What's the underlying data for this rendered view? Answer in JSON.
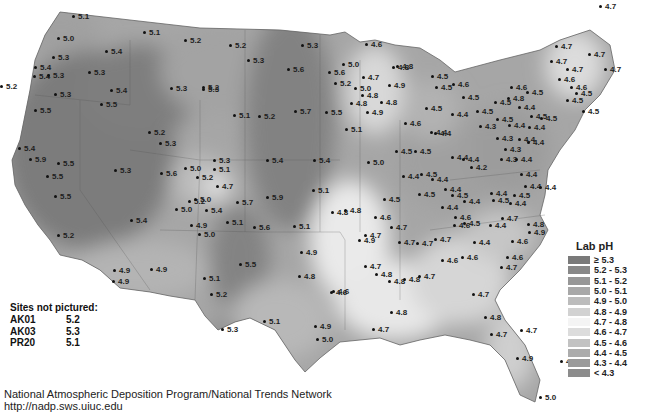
{
  "map": {
    "title": "Lab pH",
    "legend": {
      "title": "Lab pH",
      "items": [
        {
          "label": "≥ 5.3",
          "color": "#7a7a7a"
        },
        {
          "label": "5.2 - 5.3",
          "color": "#888888"
        },
        {
          "label": "5.1 - 5.2",
          "color": "#979797"
        },
        {
          "label": "5.0 - 5.1",
          "color": "#a8a8a8"
        },
        {
          "label": "4.9 - 5.0",
          "color": "#bcbcbc"
        },
        {
          "label": "4.8 - 4.9",
          "color": "#d2d2d2"
        },
        {
          "label": "4.7 - 4.8",
          "color": "#f4f4f4"
        },
        {
          "label": "4.6 - 4.7",
          "color": "#dcdcdc"
        },
        {
          "label": "4.5 - 4.6",
          "color": "#c2c2c2"
        },
        {
          "label": "4.4 - 4.5",
          "color": "#acacac"
        },
        {
          "label": "4.3 - 4.4",
          "color": "#9a9a9a"
        },
        {
          "label": "< 4.3",
          "color": "#8c8c8c"
        }
      ]
    },
    "sites_not_pictured": {
      "header": "Sites not pictured:",
      "rows": [
        {
          "id": "AK01",
          "value": "5.2"
        },
        {
          "id": "AK03",
          "value": "5.3"
        },
        {
          "id": "PR20",
          "value": "5.1"
        }
      ]
    },
    "footer": {
      "line1": "National Atmospheric Deposition Program/National Trends Network",
      "line2": "http://nadp.sws.uiuc.edu"
    },
    "sites": [
      {
        "x": 72,
        "y": 17,
        "v": "5.1"
      },
      {
        "x": 57,
        "y": 39,
        "v": "5.0"
      },
      {
        "x": 52,
        "y": 58,
        "v": "5.3"
      },
      {
        "x": 105,
        "y": 52,
        "v": "5.4"
      },
      {
        "x": 34,
        "y": 68,
        "v": "5.4"
      },
      {
        "x": 33,
        "y": 77,
        "v": "5.4"
      },
      {
        "x": 47,
        "y": 76,
        "v": "5.3"
      },
      {
        "x": 88,
        "y": 73,
        "v": "5.3"
      },
      {
        "x": 110,
        "y": 91,
        "v": "5.4"
      },
      {
        "x": 54,
        "y": 95,
        "v": "5.3"
      },
      {
        "x": 100,
        "y": 105,
        "v": "5.5"
      },
      {
        "x": 34,
        "y": 111,
        "v": "5.5"
      },
      {
        "x": 143,
        "y": 33,
        "v": "5.1"
      },
      {
        "x": 184,
        "y": 41,
        "v": "5.2"
      },
      {
        "x": 229,
        "y": 46,
        "v": "5.2"
      },
      {
        "x": 247,
        "y": 61,
        "v": "5.3"
      },
      {
        "x": 202,
        "y": 90,
        "v": "5.3"
      },
      {
        "x": 170,
        "y": 89,
        "v": "5.3"
      },
      {
        "x": 301,
        "y": 46,
        "v": "5.3"
      },
      {
        "x": 287,
        "y": 70,
        "v": "5.6"
      },
      {
        "x": 342,
        "y": 65,
        "v": "5.0"
      },
      {
        "x": 328,
        "y": 73,
        "v": "5.6"
      },
      {
        "x": 334,
        "y": 84,
        "v": "5.2"
      },
      {
        "x": 354,
        "y": 89,
        "v": "5.0"
      },
      {
        "x": 202,
        "y": 88,
        "v": "5.2"
      },
      {
        "x": 0,
        "y": 87,
        "v": "5.2"
      },
      {
        "x": 233,
        "y": 116,
        "v": "5.1"
      },
      {
        "x": 258,
        "y": 117,
        "v": "5.2"
      },
      {
        "x": 294,
        "y": 112,
        "v": "5.7"
      },
      {
        "x": 325,
        "y": 113,
        "v": "5.5"
      },
      {
        "x": 148,
        "y": 133,
        "v": "5.2"
      },
      {
        "x": 159,
        "y": 144,
        "v": "5.3"
      },
      {
        "x": 18,
        "y": 149,
        "v": "5.4"
      },
      {
        "x": 29,
        "y": 160,
        "v": "5.9"
      },
      {
        "x": 57,
        "y": 164,
        "v": "5.5"
      },
      {
        "x": 46,
        "y": 177,
        "v": "5.5"
      },
      {
        "x": 54,
        "y": 197,
        "v": "5.5"
      },
      {
        "x": 114,
        "y": 171,
        "v": "5.3"
      },
      {
        "x": 160,
        "y": 174,
        "v": "5.6"
      },
      {
        "x": 57,
        "y": 236,
        "v": "5.2"
      },
      {
        "x": 130,
        "y": 221,
        "v": "5.4"
      },
      {
        "x": 184,
        "y": 169,
        "v": "5.0"
      },
      {
        "x": 213,
        "y": 161,
        "v": "5.3"
      },
      {
        "x": 213,
        "y": 170,
        "v": "5.1"
      },
      {
        "x": 196,
        "y": 178,
        "v": "5.2"
      },
      {
        "x": 216,
        "y": 187,
        "v": "4.7"
      },
      {
        "x": 188,
        "y": 202,
        "v": "5.2"
      },
      {
        "x": 175,
        "y": 210,
        "v": "5.0"
      },
      {
        "x": 205,
        "y": 211,
        "v": "5.4"
      },
      {
        "x": 194,
        "y": 200,
        "v": "5.0"
      },
      {
        "x": 236,
        "y": 203,
        "v": "5.7"
      },
      {
        "x": 266,
        "y": 198,
        "v": "5.9"
      },
      {
        "x": 266,
        "y": 161,
        "v": "5.4"
      },
      {
        "x": 313,
        "y": 161,
        "v": "5.4"
      },
      {
        "x": 312,
        "y": 191,
        "v": "5.1"
      },
      {
        "x": 331,
        "y": 213,
        "v": "4.8"
      },
      {
        "x": 253,
        "y": 228,
        "v": "5.6"
      },
      {
        "x": 293,
        "y": 227,
        "v": "5.1"
      },
      {
        "x": 190,
        "y": 226,
        "v": "4.9"
      },
      {
        "x": 198,
        "y": 235,
        "v": "5.0"
      },
      {
        "x": 226,
        "y": 223,
        "v": "5.1"
      },
      {
        "x": 239,
        "y": 265,
        "v": "5.5"
      },
      {
        "x": 300,
        "y": 253,
        "v": "4.9"
      },
      {
        "x": 298,
        "y": 277,
        "v": "4.8"
      },
      {
        "x": 113,
        "y": 271,
        "v": "4.9"
      },
      {
        "x": 150,
        "y": 270,
        "v": "4.9"
      },
      {
        "x": 112,
        "y": 282,
        "v": "4.9"
      },
      {
        "x": 203,
        "y": 279,
        "v": "5.1"
      },
      {
        "x": 210,
        "y": 295,
        "v": "5.2"
      },
      {
        "x": 221,
        "y": 330,
        "v": "5.3"
      },
      {
        "x": 263,
        "y": 322,
        "v": "5.1"
      },
      {
        "x": 316,
        "y": 340,
        "v": "5.0"
      },
      {
        "x": 314,
        "y": 327,
        "v": "4.9"
      },
      {
        "x": 330,
        "y": 293,
        "v": "4.6"
      },
      {
        "x": 365,
        "y": 45,
        "v": "4.6"
      },
      {
        "x": 392,
        "y": 68,
        "v": "4.8"
      },
      {
        "x": 362,
        "y": 78,
        "v": "4.7"
      },
      {
        "x": 388,
        "y": 86,
        "v": "4.9"
      },
      {
        "x": 396,
        "y": 67,
        "v": "4.8"
      },
      {
        "x": 361,
        "y": 96,
        "v": "4.8"
      },
      {
        "x": 350,
        "y": 104,
        "v": "4.8"
      },
      {
        "x": 366,
        "y": 113,
        "v": "4.9"
      },
      {
        "x": 345,
        "y": 130,
        "v": "5.1"
      },
      {
        "x": 380,
        "y": 103,
        "v": "4.8"
      },
      {
        "x": 431,
        "y": 77,
        "v": "4.5"
      },
      {
        "x": 435,
        "y": 88,
        "v": "4.5"
      },
      {
        "x": 425,
        "y": 109,
        "v": "4.5"
      },
      {
        "x": 404,
        "y": 124,
        "v": "4.6"
      },
      {
        "x": 430,
        "y": 133,
        "v": "4.4"
      },
      {
        "x": 414,
        "y": 152,
        "v": "4.5"
      },
      {
        "x": 395,
        "y": 152,
        "v": "4.5"
      },
      {
        "x": 367,
        "y": 163,
        "v": "5.0"
      },
      {
        "x": 402,
        "y": 177,
        "v": "4.4"
      },
      {
        "x": 420,
        "y": 175,
        "v": "4.5"
      },
      {
        "x": 418,
        "y": 195,
        "v": "4.5"
      },
      {
        "x": 383,
        "y": 200,
        "v": "4.5"
      },
      {
        "x": 390,
        "y": 228,
        "v": "4.7"
      },
      {
        "x": 344,
        "y": 211,
        "v": "4.8"
      },
      {
        "x": 374,
        "y": 218,
        "v": "4.6"
      },
      {
        "x": 358,
        "y": 241,
        "v": "4.9"
      },
      {
        "x": 364,
        "y": 236,
        "v": "4.7"
      },
      {
        "x": 398,
        "y": 243,
        "v": "4.7"
      },
      {
        "x": 364,
        "y": 267,
        "v": "4.7"
      },
      {
        "x": 375,
        "y": 275,
        "v": "4.8"
      },
      {
        "x": 332,
        "y": 292,
        "v": "4.6"
      },
      {
        "x": 388,
        "y": 282,
        "v": "4.8"
      },
      {
        "x": 403,
        "y": 280,
        "v": "4.8"
      },
      {
        "x": 418,
        "y": 277,
        "v": "4.7"
      },
      {
        "x": 390,
        "y": 313,
        "v": "4.8"
      },
      {
        "x": 372,
        "y": 330,
        "v": "4.7"
      },
      {
        "x": 431,
        "y": 180,
        "v": "4.4"
      },
      {
        "x": 451,
        "y": 158,
        "v": "4.4"
      },
      {
        "x": 462,
        "y": 160,
        "v": "4.4"
      },
      {
        "x": 470,
        "y": 168,
        "v": "4.2"
      },
      {
        "x": 434,
        "y": 134,
        "v": "4.4"
      },
      {
        "x": 451,
        "y": 115,
        "v": "4.4"
      },
      {
        "x": 479,
        "y": 127,
        "v": "4.3"
      },
      {
        "x": 444,
        "y": 190,
        "v": "4.4"
      },
      {
        "x": 451,
        "y": 196,
        "v": "4.5"
      },
      {
        "x": 463,
        "y": 202,
        "v": "4.4"
      },
      {
        "x": 441,
        "y": 208,
        "v": "4.4"
      },
      {
        "x": 454,
        "y": 218,
        "v": "4.6"
      },
      {
        "x": 463,
        "y": 224,
        "v": "4.5"
      },
      {
        "x": 453,
        "y": 226,
        "v": "4.6"
      },
      {
        "x": 416,
        "y": 244,
        "v": "4.7"
      },
      {
        "x": 434,
        "y": 240,
        "v": "4.7"
      },
      {
        "x": 441,
        "y": 261,
        "v": "4.6"
      },
      {
        "x": 461,
        "y": 258,
        "v": "4.6"
      },
      {
        "x": 473,
        "y": 243,
        "v": "4.4"
      },
      {
        "x": 501,
        "y": 219,
        "v": "4.7"
      },
      {
        "x": 489,
        "y": 226,
        "v": "4.4"
      },
      {
        "x": 527,
        "y": 225,
        "v": "4.8"
      },
      {
        "x": 528,
        "y": 233,
        "v": "4.9"
      },
      {
        "x": 511,
        "y": 242,
        "v": "4.6"
      },
      {
        "x": 506,
        "y": 258,
        "v": "4.6"
      },
      {
        "x": 500,
        "y": 268,
        "v": "4.7"
      },
      {
        "x": 472,
        "y": 295,
        "v": "4.7"
      },
      {
        "x": 484,
        "y": 318,
        "v": "4.8"
      },
      {
        "x": 490,
        "y": 335,
        "v": "4.7"
      },
      {
        "x": 516,
        "y": 359,
        "v": "4.9"
      },
      {
        "x": 539,
        "y": 398,
        "v": "5.0"
      },
      {
        "x": 520,
        "y": 331,
        "v": "4.7"
      },
      {
        "x": 560,
        "y": 362,
        "v": "4.7"
      },
      {
        "x": 452,
        "y": 85,
        "v": "4.6"
      },
      {
        "x": 462,
        "y": 98,
        "v": "4.5"
      },
      {
        "x": 476,
        "y": 112,
        "v": "4.5"
      },
      {
        "x": 494,
        "y": 103,
        "v": "4.5"
      },
      {
        "x": 555,
        "y": 47,
        "v": "4.7"
      },
      {
        "x": 550,
        "y": 62,
        "v": "4.7"
      },
      {
        "x": 566,
        "y": 70,
        "v": "4.7"
      },
      {
        "x": 558,
        "y": 80,
        "v": "4.6"
      },
      {
        "x": 507,
        "y": 99,
        "v": "4.8"
      },
      {
        "x": 510,
        "y": 88,
        "v": "4.6"
      },
      {
        "x": 526,
        "y": 93,
        "v": "4.5"
      },
      {
        "x": 518,
        "y": 108,
        "v": "4.4"
      },
      {
        "x": 530,
        "y": 117,
        "v": "4.5"
      },
      {
        "x": 540,
        "y": 119,
        "v": "4.5"
      },
      {
        "x": 528,
        "y": 128,
        "v": "4.4"
      },
      {
        "x": 518,
        "y": 140,
        "v": "4.4"
      },
      {
        "x": 496,
        "y": 120,
        "v": "4.5"
      },
      {
        "x": 508,
        "y": 126,
        "v": "4.4"
      },
      {
        "x": 496,
        "y": 139,
        "v": "4.3"
      },
      {
        "x": 504,
        "y": 150,
        "v": "4.3"
      },
      {
        "x": 500,
        "y": 160,
        "v": "4.3"
      },
      {
        "x": 515,
        "y": 160,
        "v": "4.4"
      },
      {
        "x": 527,
        "y": 143,
        "v": "4.4"
      },
      {
        "x": 520,
        "y": 175,
        "v": "4.4"
      },
      {
        "x": 524,
        "y": 187,
        "v": "4.4"
      },
      {
        "x": 539,
        "y": 188,
        "v": "4.4"
      },
      {
        "x": 513,
        "y": 196,
        "v": "4.5"
      },
      {
        "x": 509,
        "y": 204,
        "v": "4.4"
      },
      {
        "x": 490,
        "y": 194,
        "v": "4.4"
      },
      {
        "x": 492,
        "y": 201,
        "v": "4.5"
      },
      {
        "x": 599,
        "y": 7,
        "v": "4.7"
      },
      {
        "x": 588,
        "y": 55,
        "v": "4.7"
      },
      {
        "x": 604,
        "y": 70,
        "v": "4.7"
      },
      {
        "x": 582,
        "y": 112,
        "v": "4.5"
      },
      {
        "x": 566,
        "y": 101,
        "v": "4.5"
      },
      {
        "x": 575,
        "y": 94,
        "v": "4.5"
      },
      {
        "x": 570,
        "y": 88,
        "v": "4.6"
      }
    ]
  }
}
